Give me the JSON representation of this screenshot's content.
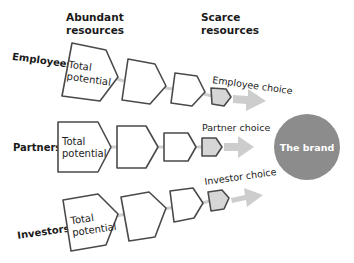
{
  "headers": {
    "abundant": [
      "Abundant",
      "resources"
    ],
    "scarce": [
      "Scarce",
      "resources"
    ]
  },
  "brand": {
    "label": "The brand",
    "color": "#8c8c8c",
    "text_color": "#ffffff"
  },
  "colors": {
    "outline": "#4a4a4a",
    "final_fill": "#d6d6d6",
    "arrow": "#cdcdcd",
    "connector": "#cfcfcf"
  },
  "rows": [
    {
      "label": "Employees",
      "first_shape_text": [
        "Total",
        "potential"
      ],
      "choice_label": "Employee choice"
    },
    {
      "label": "Partners",
      "first_shape_text": [
        "Total",
        "potential"
      ],
      "choice_label": "Partner choice"
    },
    {
      "label": "Investors",
      "first_shape_text": [
        "Total",
        "potential"
      ],
      "choice_label": "Investor choice"
    }
  ]
}
